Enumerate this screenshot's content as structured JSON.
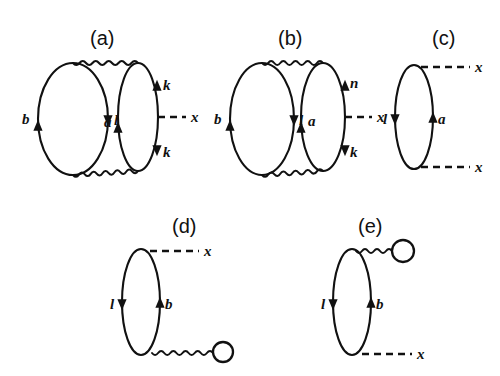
{
  "figure": {
    "background_color": "#ffffff",
    "ink_color": "#111111",
    "width": 500,
    "height": 376
  },
  "panels": [
    {
      "id": "a",
      "label": "(a)",
      "label_x": 90,
      "label_y": 45,
      "description": "Two fermion loops joined by two wavy interaction lines, right loop attached to a dashed external line x",
      "loops": [
        {
          "name": "left-loop",
          "cx": 73,
          "cy": 119,
          "rx": 35,
          "ry": 56
        },
        {
          "name": "right-loop",
          "cx": 138,
          "cy": 117,
          "rx": 20,
          "ry": 54
        }
      ],
      "wavy_lines": [
        {
          "name": "top-interaction",
          "x1": 73,
          "y1": 63,
          "x2": 138,
          "y2": 63
        },
        {
          "name": "bottom-interaction",
          "x1": 73,
          "y1": 175,
          "x2": 138,
          "y2": 171
        }
      ],
      "dashed_lines": [
        {
          "name": "external-x",
          "x1": 158,
          "y1": 117,
          "x2": 186,
          "y2": 117
        }
      ],
      "arrows": [
        {
          "name": "arrow-b",
          "x": 38,
          "y": 128,
          "dir": "up",
          "label": "b",
          "label_x": 22,
          "label_y": 124
        },
        {
          "name": "arrow-l",
          "x": 108,
          "y": 118,
          "dir": "down",
          "label": "l",
          "label_x": 114,
          "label_y": 125
        },
        {
          "name": "arrow-a",
          "x": 118,
          "y": 130,
          "dir": "up",
          "label": "a",
          "label_x": 104,
          "label_y": 127
        },
        {
          "name": "arrow-k-upper",
          "x": 157,
          "y": 88,
          "dir": "up",
          "label": "k",
          "label_x": 163,
          "label_y": 90
        },
        {
          "name": "arrow-k-lower",
          "x": 157,
          "y": 148,
          "dir": "down",
          "label": "k",
          "label_x": 163,
          "label_y": 157
        }
      ],
      "external_labels": [
        {
          "name": "external-x-label",
          "text": "x",
          "x": 191,
          "y": 122
        }
      ]
    },
    {
      "id": "b",
      "label": "(b)",
      "label_x": 278,
      "label_y": 45,
      "description": "Two fermion loops joined by two wavy interaction lines, right loop carries labels n and k and a dashed external line x",
      "loops": [
        {
          "name": "left-loop",
          "cx": 262,
          "cy": 119,
          "rx": 32,
          "ry": 56
        },
        {
          "name": "right-loop",
          "cx": 323,
          "cy": 117,
          "rx": 22,
          "ry": 54
        }
      ],
      "wavy_lines": [
        {
          "name": "top-interaction",
          "x1": 262,
          "y1": 63,
          "x2": 323,
          "y2": 63
        },
        {
          "name": "bottom-interaction",
          "x1": 262,
          "y1": 175,
          "x2": 323,
          "y2": 171
        }
      ],
      "dashed_lines": [
        {
          "name": "external-x",
          "x1": 345,
          "y1": 117,
          "x2": 372,
          "y2": 117
        }
      ],
      "arrows": [
        {
          "name": "arrow-b",
          "x": 230,
          "y": 128,
          "dir": "up",
          "label": "b",
          "label_x": 214,
          "label_y": 124
        },
        {
          "name": "arrow-l",
          "x": 294,
          "y": 118,
          "dir": "down",
          "label": "l",
          "label_x": 299,
          "label_y": 125
        },
        {
          "name": "arrow-a",
          "x": 301,
          "y": 130,
          "dir": "up",
          "label": "a",
          "label_x": 308,
          "label_y": 126
        },
        {
          "name": "arrow-n",
          "x": 345,
          "y": 88,
          "dir": "up",
          "label": "n",
          "label_x": 350,
          "label_y": 88
        },
        {
          "name": "arrow-k",
          "x": 345,
          "y": 148,
          "dir": "down",
          "label": "k",
          "label_x": 350,
          "label_y": 157
        }
      ],
      "external_labels": [
        {
          "name": "external-x-label",
          "text": "x",
          "x": 377,
          "y": 122
        }
      ]
    },
    {
      "id": "c",
      "label": "(c)",
      "label_x": 432,
      "label_y": 45,
      "description": "Single fermion loop with two dashed external lines x at top and bottom",
      "loops": [
        {
          "name": "main-loop",
          "cx": 414,
          "cy": 117,
          "rx": 19,
          "ry": 52
        }
      ],
      "wavy_lines": [],
      "dashed_lines": [
        {
          "name": "external-x-top",
          "x1": 421,
          "y1": 67,
          "x2": 470,
          "y2": 67
        },
        {
          "name": "external-x-bottom",
          "x1": 421,
          "y1": 167,
          "x2": 470,
          "y2": 167
        }
      ],
      "arrows": [
        {
          "name": "arrow-l",
          "x": 395,
          "y": 117,
          "dir": "down",
          "label": "l",
          "label_x": 383,
          "label_y": 124
        },
        {
          "name": "arrow-a",
          "x": 433,
          "y": 120,
          "dir": "up",
          "label": "a",
          "label_x": 438,
          "label_y": 124
        }
      ],
      "external_labels": [
        {
          "name": "external-x-top-label",
          "text": "x",
          "x": 475,
          "y": 72
        },
        {
          "name": "external-x-bottom-label",
          "text": "x",
          "x": 475,
          "y": 172
        }
      ]
    },
    {
      "id": "d",
      "label": "(d)",
      "label_x": 172,
      "label_y": 233,
      "description": "Single fermion loop with a dashed external line x at top and a wavy tadpole line ending in a small circle at bottom right",
      "loops": [
        {
          "name": "main-loop",
          "cx": 141,
          "cy": 302,
          "rx": 19,
          "ry": 53
        }
      ],
      "wavy_lines": [
        {
          "name": "tadpole-stem",
          "x1": 152,
          "y1": 353,
          "x2": 213,
          "y2": 353
        }
      ],
      "dashed_lines": [
        {
          "name": "external-x",
          "x1": 150,
          "y1": 251,
          "x2": 199,
          "y2": 251
        }
      ],
      "tadpole": {
        "name": "tadpole-loop",
        "cx": 223,
        "cy": 352,
        "r": 10
      },
      "arrows": [
        {
          "name": "arrow-l",
          "x": 122,
          "y": 302,
          "dir": "down",
          "label": "l",
          "label_x": 110,
          "label_y": 309
        },
        {
          "name": "arrow-b",
          "x": 160,
          "y": 305,
          "dir": "up",
          "label": "b",
          "label_x": 165,
          "label_y": 309
        }
      ],
      "external_labels": [
        {
          "name": "external-x-label",
          "text": "x",
          "x": 204,
          "y": 256
        }
      ]
    },
    {
      "id": "e",
      "label": "(e)",
      "label_x": 358,
      "label_y": 233,
      "description": "Single fermion loop with a wavy tadpole line ending in a small circle at top right and a dashed external line x at bottom",
      "loops": [
        {
          "name": "main-loop",
          "cx": 352,
          "cy": 302,
          "rx": 19,
          "ry": 53
        }
      ],
      "wavy_lines": [
        {
          "name": "tadpole-stem",
          "x1": 356,
          "y1": 251,
          "x2": 392,
          "y2": 251
        }
      ],
      "dashed_lines": [
        {
          "name": "external-x",
          "x1": 362,
          "y1": 354,
          "x2": 412,
          "y2": 354
        }
      ],
      "tadpole": {
        "name": "tadpole-loop",
        "cx": 403,
        "cy": 251,
        "r": 11
      },
      "arrows": [
        {
          "name": "arrow-l",
          "x": 333,
          "y": 302,
          "dir": "down",
          "label": "l",
          "label_x": 321,
          "label_y": 309
        },
        {
          "name": "arrow-b",
          "x": 371,
          "y": 305,
          "dir": "up",
          "label": "b",
          "label_x": 376,
          "label_y": 309
        }
      ],
      "external_labels": [
        {
          "name": "external-x-label",
          "text": "x",
          "x": 417,
          "y": 359
        }
      ]
    }
  ]
}
